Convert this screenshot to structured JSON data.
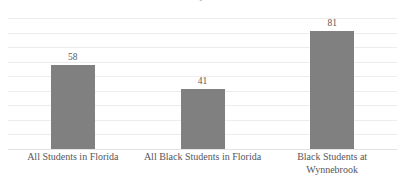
{
  "chart_data": {
    "type": "bar",
    "title": "",
    "xlabel": "",
    "ylabel": "",
    "categories": [
      "All Students in Florida",
      "All Black Students in Florida",
      "Black Students at Wynnebrook"
    ],
    "category_lines": [
      [
        "All Students in Florida"
      ],
      [
        "All Black Students in Florida"
      ],
      [
        "Black Students at",
        "Wynnebrook"
      ]
    ],
    "values": [
      58,
      41,
      81
    ],
    "value_labels": [
      "58",
      "41",
      "81"
    ],
    "ylim": [
      0,
      90
    ],
    "ytick_step": 10,
    "yticks_visible": false,
    "grid": true,
    "gridline_count": 10,
    "legend": "none",
    "bar_color": "#808080",
    "gridline_color": "#ededed",
    "baseline_color": "#e2e2e2",
    "label_color": "#55565a",
    "value_color": "#59595b"
  },
  "figure": {
    "background": "#ffffff",
    "cropped_title_remnant": "y",
    "width": 405,
    "height": 191
  }
}
